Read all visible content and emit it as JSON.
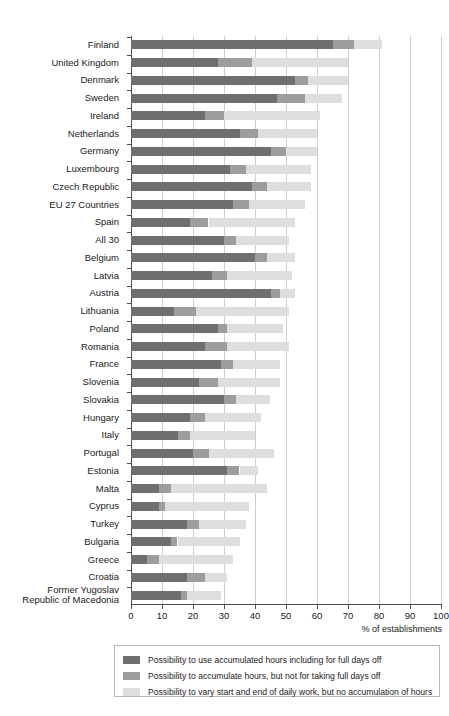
{
  "chart_data": {
    "type": "bar",
    "orientation": "horizontal",
    "stacked": true,
    "title": "",
    "subtitle": "",
    "xlabel": "% of establishments",
    "ylabel": "",
    "xlim": [
      0,
      100
    ],
    "xticks": [
      0,
      10,
      20,
      30,
      40,
      50,
      60,
      70,
      80,
      90,
      100
    ],
    "grid": "vertical",
    "legend_position": "bottom",
    "colors": {
      "series0": "#6f6f6f",
      "series1": "#9d9d9d",
      "series2": "#dedede"
    },
    "categories": [
      "Finland",
      "United Kingdom",
      "Denmark",
      "Sweden",
      "Ireland",
      "Netherlands",
      "Germany",
      "Luxembourg",
      "Czech Republic",
      "EU 27 Countries",
      "Spain",
      "All 30",
      "Belgium",
      "Latvia",
      "Austria",
      "Lithuania",
      "Poland",
      "Romania",
      "France",
      "Slovenia",
      "Slovakia",
      "Hungary",
      "Italy",
      "Portugal",
      "Estonia",
      "Malta",
      "Cyprus",
      "Turkey",
      "Bulgaria",
      "Greece",
      "Croatia",
      "Former Yugoslav Republic of Macedonia"
    ],
    "categories_wrapped": [
      [
        "Finland"
      ],
      [
        "United Kingdom"
      ],
      [
        "Denmark"
      ],
      [
        "Sweden"
      ],
      [
        "Ireland"
      ],
      [
        "Netherlands"
      ],
      [
        "Germany"
      ],
      [
        "Luxembourg"
      ],
      [
        "Czech Republic"
      ],
      [
        "EU 27 Countries"
      ],
      [
        "Spain"
      ],
      [
        "All 30"
      ],
      [
        "Belgium"
      ],
      [
        "Latvia"
      ],
      [
        "Austria"
      ],
      [
        "Lithuania"
      ],
      [
        "Poland"
      ],
      [
        "Romania"
      ],
      [
        "France"
      ],
      [
        "Slovenia"
      ],
      [
        "Slovakia"
      ],
      [
        "Hungary"
      ],
      [
        "Italy"
      ],
      [
        "Portugal"
      ],
      [
        "Estonia"
      ],
      [
        "Malta"
      ],
      [
        "Cyprus"
      ],
      [
        "Turkey"
      ],
      [
        "Bulgaria"
      ],
      [
        "Greece"
      ],
      [
        "Croatia"
      ],
      [
        "Former Yugoslav",
        "Republic of Macedonia"
      ]
    ],
    "series": [
      {
        "name": "Possibility to use accumulated hours including for full days off",
        "color": "#6f6f6f",
        "values": [
          65,
          28,
          53,
          47,
          24,
          35,
          45,
          32,
          39,
          33,
          19,
          30,
          40,
          26,
          45,
          14,
          28,
          24,
          29,
          22,
          30,
          19,
          15,
          20,
          31,
          9,
          9,
          18,
          13,
          5,
          18,
          16
        ]
      },
      {
        "name": "Possibility to accumulate hours, but not for taking full days off",
        "color": "#9d9d9d",
        "values": [
          7,
          11,
          4,
          9,
          6,
          6,
          5,
          5,
          5,
          5,
          6,
          4,
          4,
          5,
          3,
          7,
          3,
          7,
          4,
          6,
          4,
          5,
          4,
          5,
          4,
          4,
          2,
          4,
          2,
          4,
          6,
          2
        ]
      },
      {
        "name": "Possibility to vary start and end of daily work, but no accumulation of hours",
        "color": "#dedede",
        "values": [
          9,
          31,
          13,
          12,
          31,
          19,
          10,
          21,
          14,
          18,
          28,
          17,
          9,
          21,
          5,
          30,
          18,
          20,
          15,
          20,
          11,
          18,
          21,
          21,
          6,
          31,
          27,
          15,
          20,
          24,
          7,
          11
        ]
      }
    ],
    "totals": [
      81,
      70,
      70,
      68,
      61,
      60,
      60,
      58,
      58,
      56,
      53,
      51,
      53,
      52,
      53,
      51,
      49,
      51,
      48,
      48,
      45,
      42,
      40,
      46,
      41,
      44,
      38,
      37,
      35,
      33,
      31,
      29
    ]
  },
  "legend": {
    "items": [
      {
        "swatch": "series0-swatch",
        "label": "Possibility to use accumulated hours including for full days off"
      },
      {
        "swatch": "series1-swatch",
        "label": "Possibility to accumulate hours, but not for taking full days off"
      },
      {
        "swatch": "series2-swatch",
        "label": "Possibility to vary start and end of daily work, but no accumulation of hours"
      }
    ]
  },
  "axis": {
    "x_title": "% of establishments",
    "x_tick_labels": [
      "0",
      "10",
      "20",
      "30",
      "40",
      "50",
      "60",
      "70",
      "80",
      "90",
      "100"
    ]
  }
}
